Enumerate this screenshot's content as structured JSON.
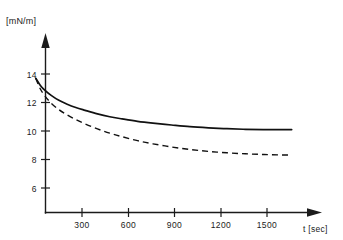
{
  "chart_data": {
    "type": "line",
    "title": "",
    "subtitle": "",
    "xlabel": "t [sec]",
    "ylabel": "[mN/m]",
    "xlim": [
      0,
      1700
    ],
    "ylim": [
      5,
      15
    ],
    "grid": false,
    "legend": "none",
    "xticks": [
      300,
      600,
      900,
      1200,
      1500
    ],
    "xtick_labels": [
      "300",
      "600",
      "900",
      "1200",
      "1500"
    ],
    "yticks": [
      6,
      8,
      10,
      12,
      14
    ],
    "ytick_labels": [
      "6",
      "8",
      "10",
      "12",
      "14"
    ],
    "series": [
      {
        "name": "solid-curve",
        "style": "solid",
        "color": "#111111",
        "x": [
          0,
          30,
          60,
          100,
          150,
          200,
          260,
          320,
          400,
          480,
          560,
          660,
          760,
          880,
          1000,
          1120,
          1240,
          1360,
          1480,
          1600,
          1660
        ],
        "values": [
          13.7,
          13.2,
          12.85,
          12.5,
          12.15,
          11.9,
          11.65,
          11.45,
          11.2,
          11.0,
          10.85,
          10.68,
          10.55,
          10.42,
          10.3,
          10.22,
          10.16,
          10.12,
          10.1,
          10.1,
          10.1
        ]
      },
      {
        "name": "dashed-curve",
        "style": "dashed",
        "color": "#111111",
        "x": [
          0,
          30,
          60,
          100,
          150,
          200,
          260,
          320,
          400,
          480,
          560,
          660,
          760,
          880,
          1000,
          1120,
          1240,
          1360,
          1480,
          1600,
          1660
        ],
        "values": [
          13.7,
          12.95,
          12.45,
          11.95,
          11.5,
          11.15,
          10.8,
          10.5,
          10.15,
          9.85,
          9.6,
          9.32,
          9.1,
          8.88,
          8.7,
          8.57,
          8.47,
          8.4,
          8.35,
          8.32,
          8.32
        ]
      }
    ],
    "axis_arrows": {
      "y_axis": "up-arrow",
      "x_axis": "right-arrow"
    }
  },
  "axes": {
    "y_unit_label": "[mN/m]",
    "x_caption": "t [sec]"
  }
}
